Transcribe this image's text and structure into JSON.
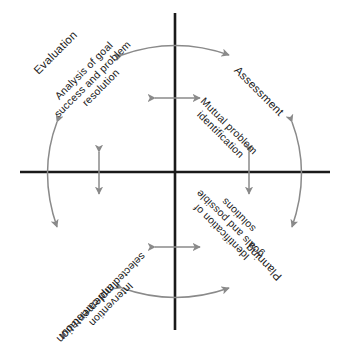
{
  "diagram": {
    "type": "cyclical-process-diagram",
    "title": "",
    "background_color": "#ffffff",
    "axis_color": "#1a1a1a",
    "arrow_color": "#8a8a8a",
    "text_color": "#1a1a1a",
    "center": {
      "x": 175,
      "y": 172
    },
    "axes": {
      "vertical": {
        "x": 175,
        "y_top": 13,
        "y_bottom": 330
      },
      "horizontal": {
        "y": 172,
        "x_left": 20,
        "x_right": 330
      }
    },
    "quadrants": [
      {
        "position": "top-left",
        "outer_label": "Evaluation",
        "inner_label_lines": [
          "Analysis of goal",
          "success and problem",
          "resolution"
        ],
        "rotation_deg": -45
      },
      {
        "position": "top-right",
        "outer_label": "Assessment",
        "inner_label_lines": [
          "Mutual problem",
          "identification"
        ],
        "rotation_deg": 45
      },
      {
        "position": "bottom-right",
        "outer_label": "Planning",
        "inner_label_lines": [
          "Identification of",
          "goals and possible",
          "solutions"
        ],
        "rotation_deg": 225
      },
      {
        "position": "bottom-left",
        "outer_label": "Implementation",
        "inner_label_lines": [
          "Intervention",
          "selected and carried out"
        ],
        "rotation_deg": 135
      }
    ],
    "connectors": [
      {
        "name": "outer-arc-top",
        "orientation": "horizontal",
        "double_headed": true
      },
      {
        "name": "outer-arc-bottom",
        "orientation": "horizontal",
        "double_headed": true
      },
      {
        "name": "outer-arc-left",
        "orientation": "vertical",
        "double_headed": true
      },
      {
        "name": "outer-arc-right",
        "orientation": "vertical",
        "double_headed": true
      },
      {
        "name": "inner-arrow-top",
        "orientation": "horizontal",
        "double_headed": true
      },
      {
        "name": "inner-arrow-bottom",
        "orientation": "horizontal",
        "double_headed": true
      },
      {
        "name": "inner-arrow-left",
        "orientation": "vertical",
        "double_headed": true
      },
      {
        "name": "inner-arrow-right",
        "orientation": "vertical",
        "double_headed": true
      }
    ]
  }
}
